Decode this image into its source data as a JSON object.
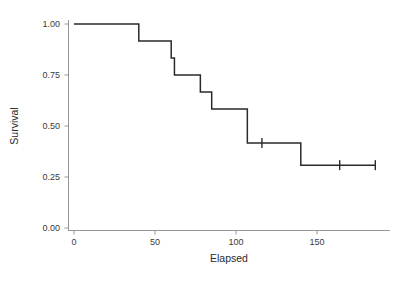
{
  "chart_data": {
    "type": "line",
    "subtype": "kaplan-meier-step",
    "title": "",
    "xlabel": "Elapsed",
    "ylabel": "Survival",
    "xlim": [
      -4,
      190
    ],
    "ylim": [
      0.0,
      1.02
    ],
    "grid": false,
    "legend": null,
    "x_ticks": [
      0,
      50,
      100,
      150
    ],
    "x_tick_labels": [
      "0",
      "50",
      "100",
      "150"
    ],
    "y_ticks": [
      0.0,
      0.25,
      0.5,
      0.75,
      1.0
    ],
    "y_tick_labels": [
      "0.00",
      "0.25",
      "0.50",
      "0.75",
      "1.00"
    ],
    "series": [
      {
        "name": "Survival",
        "color": "#2a2a2a",
        "x": [
          0,
          40,
          60,
          62,
          78,
          85,
          107,
          140,
          186
        ],
        "y": [
          1.0,
          0.917,
          0.833,
          0.75,
          0.667,
          0.583,
          0.417,
          0.308,
          0.308
        ],
        "step": "post"
      }
    ],
    "censored_points": [
      {
        "x": 116,
        "y": 0.417
      },
      {
        "x": 164,
        "y": 0.308
      },
      {
        "x": 186,
        "y": 0.308
      }
    ],
    "annotations": []
  },
  "axes": {
    "x_title": "Elapsed",
    "y_title": "Survival"
  },
  "style": {
    "curve_color": "#2a2a2a",
    "axis_color": "#8a8a8a",
    "text_color": "#3a3a3a",
    "background": "#ffffff"
  }
}
